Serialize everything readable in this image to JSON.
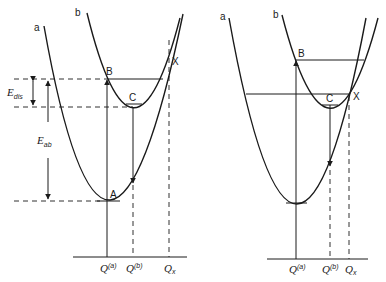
{
  "diagram": {
    "left_panel": {
      "curve_labels": {
        "a": "a",
        "b": "b"
      },
      "points": {
        "A": "A",
        "B": "B",
        "C": "C",
        "X": "X"
      },
      "energy_labels": {
        "dis": {
          "main": "E",
          "sub": "dis"
        },
        "ab": {
          "main": "E",
          "sub": "ab"
        }
      },
      "axis_labels": {
        "q0a": {
          "main": "Q",
          "sub": "0",
          "sup": "(a)"
        },
        "q0b": {
          "main": "Q",
          "sub": "0",
          "sup": "(b)"
        },
        "qx": {
          "main": "Q",
          "sub": "x"
        }
      }
    },
    "right_panel": {
      "curve_labels": {
        "a": "a",
        "b": "b"
      },
      "points": {
        "B": "B",
        "C": "C",
        "X": "X"
      },
      "axis_labels": {
        "q0a": {
          "main": "Q",
          "sub": "0",
          "sup": "(a)"
        },
        "q0b": {
          "main": "Q",
          "sub": "0",
          "sup": "(b)"
        },
        "qx": {
          "main": "Q",
          "sub": "x"
        }
      }
    }
  }
}
